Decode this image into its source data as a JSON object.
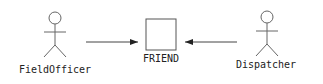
{
  "diagram": {
    "type": "use-case",
    "actors": [
      {
        "id": "field-officer",
        "label": "FieldOfficer"
      },
      {
        "id": "dispatcher",
        "label": "Dispatcher"
      }
    ],
    "system": {
      "label": "FRIEND"
    },
    "associations": [
      {
        "from": "FieldOfficer",
        "to": "FRIEND",
        "arrow": "to-system"
      },
      {
        "from": "Dispatcher",
        "to": "FRIEND",
        "arrow": "to-system"
      }
    ],
    "colors": {
      "stroke": "#555555",
      "arrow": "#222222",
      "text": "#222222",
      "background": "#ffffff"
    }
  }
}
